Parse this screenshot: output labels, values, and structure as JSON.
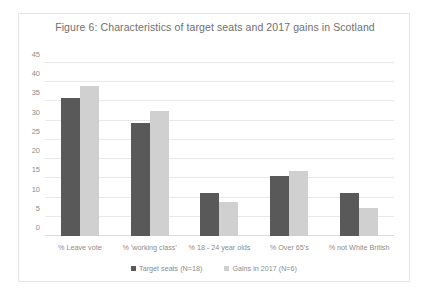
{
  "chart_data": {
    "type": "bar",
    "title": "Figure 6: Characteristics of target seats and 2017 gains in Scotland",
    "xlabel": "",
    "ylabel": "",
    "ylim": [
      0,
      45
    ],
    "yticks": [
      45,
      40,
      35,
      30,
      25,
      20,
      15,
      10,
      5,
      0
    ],
    "grid": true,
    "legend_position": "bottom",
    "categories": [
      "% Leave vote",
      "% 'working class'",
      "% 18 - 24 year olds",
      "% Over 65's",
      "% not White British"
    ],
    "series": [
      {
        "name": "Target seats (N=18)",
        "color": "#595959",
        "values": [
          36,
          29.5,
          11.2,
          15.5,
          11.2
        ]
      },
      {
        "name": "Gains in 2017 (N=6)",
        "color": "#d0d0d0",
        "values": [
          39,
          32.5,
          8.8,
          17,
          7.3
        ]
      }
    ]
  },
  "colors": {
    "series_dark": "#595959",
    "series_light": "#d0d0d0",
    "gridline": "#e8e8e8",
    "text": "#8d8d8d",
    "title_text": "#6f6f6f",
    "frame_border": "#e6e6e6",
    "background": "#ffffff"
  }
}
